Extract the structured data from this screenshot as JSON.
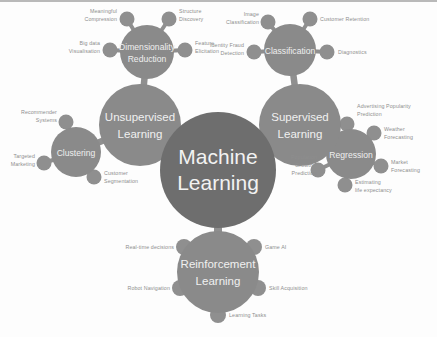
{
  "diagram": {
    "title": "Machine Learning",
    "type": "mind-map",
    "colors": {
      "background": "#fdfdfd",
      "center_node": "#6e6e6e",
      "branch_node": "#8a8a8a",
      "leaf_node": "#8f8f8f",
      "connector": "#8f8f8f",
      "center_text": "#f2f2f2",
      "branch_text": "#f0f0f0",
      "leaf_text": "#8e8e8e",
      "top_edge": "#b9b9b9"
    },
    "center": {
      "label_line1": "Machine",
      "label_line2": "Learning"
    },
    "branches": [
      {
        "id": "unsupervised-learning",
        "label_line1": "Unsupervised",
        "label_line2": "Learning",
        "sub_branches": [
          {
            "id": "dimensionality-reduction",
            "label_line1": "Dimensionality",
            "label_line2": "Reduction",
            "leaves": [
              {
                "id": "meaningful-compression",
                "line1": "Meaningful",
                "line2": "Compression"
              },
              {
                "id": "structure-discovery",
                "line1": "Structure",
                "line2": "Discovery"
              },
              {
                "id": "big-data-visualisation",
                "line1": "Big data",
                "line2": "Visualisation"
              },
              {
                "id": "feature-elicitation",
                "line1": "Feature",
                "line2": "Elicitation"
              }
            ]
          },
          {
            "id": "clustering",
            "label_line1": "Clustering",
            "label_line2": "",
            "leaves": [
              {
                "id": "recommender-systems",
                "line1": "Recommender",
                "line2": "Systems"
              },
              {
                "id": "targeted-marketing",
                "line1": "Targeted",
                "line2": "Marketing"
              },
              {
                "id": "customer-segmentation",
                "line1": "Customer",
                "line2": "Segmentation"
              }
            ]
          }
        ]
      },
      {
        "id": "supervised-learning",
        "label_line1": "Supervised",
        "label_line2": "Learning",
        "sub_branches": [
          {
            "id": "classification",
            "label_line1": "Classification",
            "label_line2": "",
            "leaves": [
              {
                "id": "image-classification",
                "line1": "Image",
                "line2": "Classification"
              },
              {
                "id": "customer-retention",
                "line1": "Customer Retention",
                "line2": ""
              },
              {
                "id": "identity-fraud-detection",
                "line1": "Identity Fraud",
                "line2": "Detection"
              },
              {
                "id": "diagnostics",
                "line1": "Diagnostics",
                "line2": ""
              }
            ]
          },
          {
            "id": "regression",
            "label_line1": "Regression",
            "label_line2": "",
            "leaves": [
              {
                "id": "advertising-popularity-prediction",
                "line1": "Advertising Popularity",
                "line2": "Prediction"
              },
              {
                "id": "weather-forecasting",
                "line1": "Weather",
                "line2": "Forecasting"
              },
              {
                "id": "market-forecasting",
                "line1": "Market",
                "line2": "Forecasting"
              },
              {
                "id": "estimating-life-expectancy",
                "line1": "Estimating",
                "line2": "life expectancy"
              },
              {
                "id": "population-growth-prediction",
                "line1": "Population",
                "line2": "Growth",
                "line3": "Prediction"
              }
            ]
          }
        ]
      },
      {
        "id": "reinforcement-learning",
        "label_line1": "Reinforcement",
        "label_line2": "Learning",
        "sub_branches": [],
        "leaves": [
          {
            "id": "real-time-decisions",
            "line1": "Real-time decisions",
            "line2": ""
          },
          {
            "id": "game-ai",
            "line1": "Game AI",
            "line2": ""
          },
          {
            "id": "robot-navigation",
            "line1": "Robot Navigation",
            "line2": ""
          },
          {
            "id": "skill-acquisition",
            "line1": "Skill Acquisition",
            "line2": ""
          },
          {
            "id": "learning-tasks",
            "line1": "Learning Tasks",
            "line2": ""
          }
        ]
      }
    ]
  }
}
